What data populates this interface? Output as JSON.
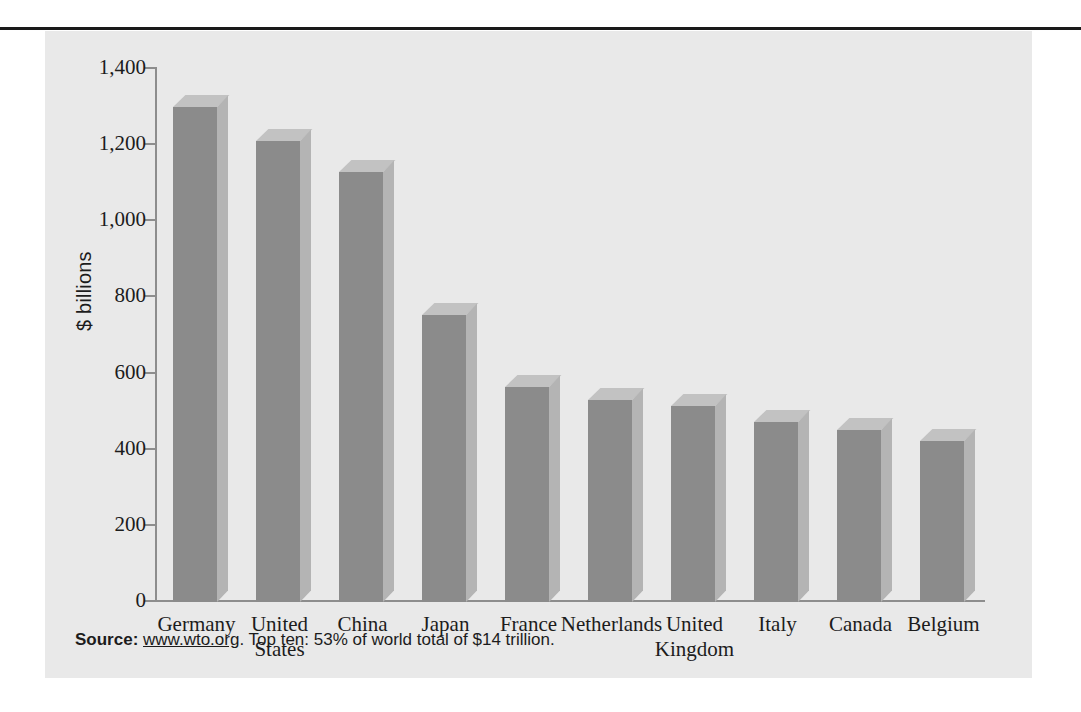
{
  "figure": {
    "source_label": "Source:",
    "source_url": "www.wto.org",
    "source_note": ". Top ten: 53% of world total of $14 trillion.",
    "panel_color": "#e9e9e9",
    "bar_front_color": "#8b8b8b",
    "bar_top_color": "#c2c2c2",
    "bar_side_color": "#b4b4b4",
    "axis_color": "#8d8d8d",
    "rule_color": "#1a1a1a"
  },
  "chart_data": {
    "type": "bar",
    "title": "",
    "subtitle": "",
    "xlabel": "",
    "ylabel": "$ billions",
    "ylim": [
      0,
      1400
    ],
    "ytick_values": [
      1400,
      1200,
      1000,
      800,
      600,
      400,
      200,
      0
    ],
    "ytick_labels": [
      "1,400",
      "1,200",
      "1,000",
      "800",
      "600",
      "400",
      "200",
      "0"
    ],
    "grid": false,
    "legend": null,
    "three_d": true,
    "categories": [
      "Germany",
      "United States",
      "China",
      "Japan",
      "France",
      "Netherlands",
      "United Kingdom",
      "Italy",
      "Canada",
      "Belgium"
    ],
    "category_label_lines": [
      [
        "Germany"
      ],
      [
        "United",
        "States"
      ],
      [
        "China"
      ],
      [
        "Japan"
      ],
      [
        "France"
      ],
      [
        "Netherlands"
      ],
      [
        "United",
        "Kingdom"
      ],
      [
        "Italy"
      ],
      [
        "Canada"
      ],
      [
        "Belgium"
      ]
    ],
    "values": [
      1300,
      1210,
      1130,
      755,
      565,
      530,
      515,
      472,
      452,
      424
    ],
    "units": "$ billions",
    "annotations": [
      "Source: www.wto.org. Top ten: 53% of world total of $14 trillion."
    ]
  }
}
